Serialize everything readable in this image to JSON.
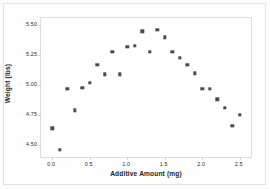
{
  "chart_data": {
    "type": "scatter",
    "title": "",
    "xlabel": "Additive Amount (mg)",
    "ylabel": "Weight (lbs)",
    "xlim": [
      -0.15,
      2.65
    ],
    "ylim": [
      4.4,
      5.56
    ],
    "xticks": [
      "0.0",
      "0.5",
      "1.0",
      "1.5",
      "2.0",
      "2.5"
    ],
    "xtick_values": [
      0.0,
      0.5,
      1.0,
      1.5,
      2.0,
      2.5
    ],
    "yticks": [
      "5.50",
      "5.25",
      "5.00",
      "4.75",
      "4.50"
    ],
    "ytick_values": [
      5.5,
      5.25,
      5.0,
      4.75,
      4.5
    ],
    "grid": false,
    "legend": null,
    "marker": "square",
    "marker_color": "#4a4a52",
    "x": [
      0.0,
      0.1,
      0.2,
      0.3,
      0.4,
      0.5,
      0.6,
      0.7,
      0.8,
      0.9,
      1.0,
      1.1,
      1.2,
      1.3,
      1.4,
      1.5,
      1.6,
      1.7,
      1.8,
      1.9,
      2.0,
      2.1,
      2.2,
      2.3,
      2.4,
      2.5
    ],
    "y": [
      4.64,
      4.46,
      4.97,
      4.79,
      4.98,
      5.02,
      5.17,
      5.09,
      5.28,
      5.09,
      5.32,
      5.33,
      5.45,
      5.28,
      5.46,
      5.4,
      5.28,
      5.23,
      5.17,
      5.1,
      4.97,
      4.97,
      4.88,
      4.81,
      4.66,
      4.75
    ],
    "points": [
      {
        "x": 0.0,
        "y": 4.64
      },
      {
        "x": 0.1,
        "y": 4.46
      },
      {
        "x": 0.2,
        "y": 4.97
      },
      {
        "x": 0.3,
        "y": 4.79
      },
      {
        "x": 0.4,
        "y": 4.98
      },
      {
        "x": 0.5,
        "y": 5.02
      },
      {
        "x": 0.6,
        "y": 5.17
      },
      {
        "x": 0.7,
        "y": 5.09
      },
      {
        "x": 0.8,
        "y": 5.28
      },
      {
        "x": 0.9,
        "y": 5.09
      },
      {
        "x": 1.0,
        "y": 5.32
      },
      {
        "x": 1.1,
        "y": 5.33
      },
      {
        "x": 1.2,
        "y": 5.45
      },
      {
        "x": 1.3,
        "y": 5.28
      },
      {
        "x": 1.4,
        "y": 5.46
      },
      {
        "x": 1.5,
        "y": 5.4
      },
      {
        "x": 1.6,
        "y": 5.28
      },
      {
        "x": 1.7,
        "y": 5.23
      },
      {
        "x": 1.8,
        "y": 5.17
      },
      {
        "x": 1.9,
        "y": 5.1
      },
      {
        "x": 2.0,
        "y": 4.97
      },
      {
        "x": 2.1,
        "y": 4.97
      },
      {
        "x": 2.2,
        "y": 4.88
      },
      {
        "x": 2.3,
        "y": 4.81
      },
      {
        "x": 2.4,
        "y": 4.66
      },
      {
        "x": 2.5,
        "y": 4.75
      }
    ]
  },
  "colors": {
    "marker": "#4a4a52",
    "axis": "#dcdcdc",
    "text": "#1c1c1c",
    "background": "#ffffff"
  }
}
